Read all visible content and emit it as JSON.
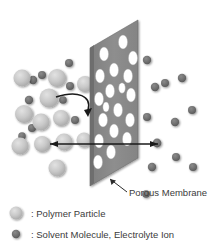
{
  "figure": {
    "background_color": "#ffffff"
  },
  "callouts": [
    {
      "id": "porous-membrane",
      "label": "Porous Membrane",
      "text_x": 129,
      "text_y": 196,
      "leader": {
        "x1": 127,
        "y1": 192,
        "x2": 110,
        "y2": 179
      }
    }
  ],
  "legend": {
    "items": [
      {
        "id": "polymer-particle",
        "label": ": Polymer Particle",
        "marker": "filled-circle-icon",
        "marker_color": "#b8b8b8",
        "marker_radius": 6.5,
        "marker_cx": 16,
        "marker_cy": 213,
        "text_x": 31,
        "text_y": 217
      },
      {
        "id": "solvent-molecule",
        "label": ": Solvent Molecule, Electrolyte Ion",
        "marker": "filled-circle-icon",
        "marker_color": "#6e6e6e",
        "marker_radius": 4.2,
        "marker_cx": 16,
        "marker_cy": 234,
        "text_x": 31,
        "text_y": 238
      }
    ]
  },
  "membrane": {
    "id": "porous-membrane-slab",
    "face_color": "#8c8c8c",
    "edge_color": "#6b6b6b",
    "pore_color": "#ffffff",
    "face_points": "90,48 138,20 138,158 90,186",
    "edge_points": "90,48 94,45 94,183 90,186",
    "pores": [
      {
        "cx": 123,
        "cy": 42,
        "rx": 4.6,
        "ry": 7.0
      },
      {
        "cx": 104,
        "cy": 54,
        "rx": 4.6,
        "ry": 7.0
      },
      {
        "cx": 133,
        "cy": 58,
        "rx": 4.6,
        "ry": 7.0
      },
      {
        "cx": 114,
        "cy": 70,
        "rx": 4.6,
        "ry": 7.0
      },
      {
        "cx": 100,
        "cy": 76,
        "rx": 4.6,
        "ry": 7.0
      },
      {
        "cx": 128,
        "cy": 76,
        "rx": 4.6,
        "ry": 7.0
      },
      {
        "cx": 110,
        "cy": 91,
        "rx": 4.6,
        "ry": 7.0
      },
      {
        "cx": 131,
        "cy": 95,
        "rx": 4.6,
        "ry": 7.0
      },
      {
        "cx": 99,
        "cy": 99,
        "rx": 4.6,
        "ry": 7.0
      },
      {
        "cx": 118,
        "cy": 110,
        "rx": 4.6,
        "ry": 7.0
      },
      {
        "cx": 103,
        "cy": 120,
        "rx": 4.6,
        "ry": 7.0
      },
      {
        "cx": 130,
        "cy": 120,
        "rx": 4.6,
        "ry": 7.0
      },
      {
        "cx": 114,
        "cy": 131,
        "rx": 4.6,
        "ry": 7.0
      },
      {
        "cx": 99,
        "cy": 141,
        "rx": 4.6,
        "ry": 7.0
      },
      {
        "cx": 127,
        "cy": 139,
        "rx": 4.6,
        "ry": 7.0
      },
      {
        "cx": 111,
        "cy": 152,
        "rx": 4.6,
        "ry": 7.0
      },
      {
        "cx": 98,
        "cy": 162,
        "rx": 4.6,
        "ry": 7.0
      },
      {
        "cx": 122,
        "cy": 88,
        "rx": 3.4,
        "ry": 5.2
      },
      {
        "cx": 106,
        "cy": 107,
        "rx": 3.2,
        "ry": 5.0
      }
    ]
  },
  "particles": {
    "polymer": {
      "color": "#c2c2c2",
      "highlight_color": "#dcdcdc",
      "items": [
        {
          "cx": 22,
          "cy": 78,
          "r": 8.5
        },
        {
          "cx": 57,
          "cy": 78,
          "r": 9.0
        },
        {
          "cx": 49,
          "cy": 98,
          "r": 9.5
        },
        {
          "cx": 24,
          "cy": 114,
          "r": 9.0
        },
        {
          "cx": 41,
          "cy": 122,
          "r": 8.5
        },
        {
          "cx": 61,
          "cy": 118,
          "r": 8.0
        },
        {
          "cx": 20,
          "cy": 146,
          "r": 8.5
        },
        {
          "cx": 42,
          "cy": 144,
          "r": 8.0
        },
        {
          "cx": 64,
          "cy": 142,
          "r": 8.5
        },
        {
          "cx": 57,
          "cy": 168,
          "r": 8.5
        },
        {
          "cx": 85,
          "cy": 84,
          "r": 8.0
        },
        {
          "cx": 84,
          "cy": 140,
          "r": 7.5
        }
      ]
    },
    "solvent": {
      "color": "#6e6e6e",
      "items": [
        {
          "cx": 69,
          "cy": 63,
          "r": 4.0
        },
        {
          "cx": 33,
          "cy": 80,
          "r": 4.2
        },
        {
          "cx": 42,
          "cy": 75,
          "r": 4.0
        },
        {
          "cx": 70,
          "cy": 86,
          "r": 4.0
        },
        {
          "cx": 29,
          "cy": 100,
          "r": 4.2
        },
        {
          "cx": 63,
          "cy": 100,
          "r": 3.8
        },
        {
          "cx": 32,
          "cy": 128,
          "r": 4.0
        },
        {
          "cx": 22,
          "cy": 136,
          "r": 3.8
        },
        {
          "cx": 45,
          "cy": 143,
          "r": 4.4
        },
        {
          "cx": 75,
          "cy": 120,
          "r": 4.0
        },
        {
          "cx": 147,
          "cy": 60,
          "r": 4.2
        },
        {
          "cx": 182,
          "cy": 78,
          "r": 4.2
        },
        {
          "cx": 165,
          "cy": 83,
          "r": 4.0
        },
        {
          "cx": 155,
          "cy": 87,
          "r": 4.2
        },
        {
          "cx": 192,
          "cy": 110,
          "r": 4.0
        },
        {
          "cx": 175,
          "cy": 122,
          "r": 4.2
        },
        {
          "cx": 147,
          "cy": 117,
          "r": 4.0
        },
        {
          "cx": 157,
          "cy": 143,
          "r": 4.4
        },
        {
          "cx": 176,
          "cy": 157,
          "r": 4.0
        },
        {
          "cx": 152,
          "cy": 167,
          "r": 4.2
        },
        {
          "cx": 193,
          "cy": 167,
          "r": 4.0
        },
        {
          "cx": 146,
          "cy": 194,
          "r": 3.8
        }
      ]
    }
  },
  "arrows": {
    "rejection": {
      "id": "polymer-rejection-arrow",
      "path": "M 56 97 C 78 90, 92 96, 88 110",
      "head": "84,110 92,108 88,117",
      "color": "#1a1a1a"
    },
    "permeation_left": {
      "id": "solvent-permeation-arrow-left",
      "x1": 117,
      "y1": 144,
      "x2": 50,
      "y2": 144,
      "head": "50,144 58,141 58,147",
      "color": "#1a1a1a"
    },
    "permeation_right": {
      "id": "solvent-permeation-arrow-right",
      "x1": 117,
      "y1": 144,
      "x2": 158,
      "y2": 144,
      "head": "158,144 150,141 150,147",
      "color": "#1a1a1a"
    }
  }
}
